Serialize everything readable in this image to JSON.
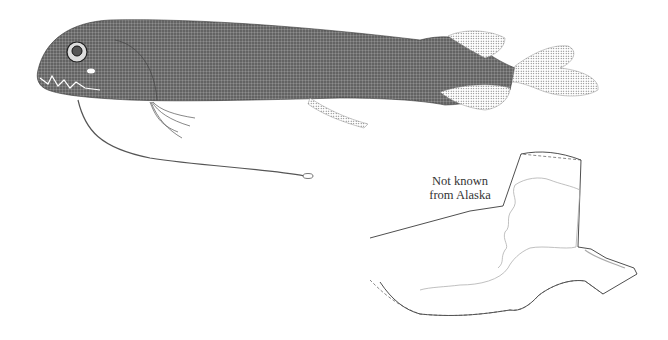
{
  "illustration": {
    "subject": "deep-sea dragonfish with long chin barbel",
    "style": "stipple drawing, grayscale"
  },
  "map": {
    "label_line1": "Not known",
    "label_line2": "from Alaska",
    "region": "Alaska outline map"
  },
  "colors": {
    "background": "#ffffff",
    "body": "#6a6a6a",
    "outline": "#222222",
    "coast": "#b0b0b0"
  }
}
